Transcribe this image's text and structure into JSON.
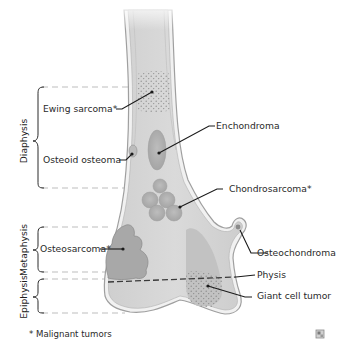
{
  "figure": {
    "regions": [
      {
        "id": "diaphysis",
        "label": "Diaphysis"
      },
      {
        "id": "metaphysis",
        "label": "Metaphysis"
      },
      {
        "id": "epiphysis",
        "label": "Epiphysis"
      }
    ],
    "labels": {
      "ewing": "Ewing sarcoma*",
      "osteoid": "Osteoid osteoma",
      "enchondroma": "Enchondroma",
      "chondrosarcoma": "Chondrosarcoma*",
      "osteosarcoma": "Osteosarcoma*",
      "osteochondroma": "Osteochondroma",
      "physis": "Physis",
      "giant_cell": "Giant cell tumor"
    },
    "footnote": "* Malignant tumors",
    "colors": {
      "bone_fill": "#d6d6d6",
      "bone_outline": "#9a9a9a",
      "cortex": "#eeeeee",
      "lesion": "#a9a9a9",
      "leader": "#1a1a1a",
      "dashed": "#b8b8b8"
    },
    "icon": "image-enlarge-icon"
  }
}
